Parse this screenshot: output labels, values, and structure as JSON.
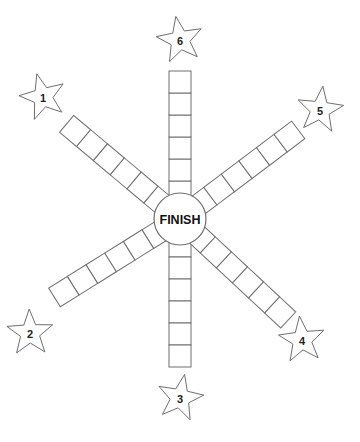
{
  "board": {
    "center_label": "FINISH",
    "arms": [
      {
        "id": "arm-1",
        "start_label": "1",
        "squares": 6
      },
      {
        "id": "arm-2",
        "start_label": "2",
        "squares": 6
      },
      {
        "id": "arm-3",
        "start_label": "3",
        "squares": 6
      },
      {
        "id": "arm-4",
        "start_label": "4",
        "squares": 6
      },
      {
        "id": "arm-5",
        "start_label": "5",
        "squares": 6
      },
      {
        "id": "arm-6",
        "start_label": "6",
        "squares": 6
      }
    ],
    "colors": {
      "line": "#6e6e6e",
      "text": "#111111",
      "background": "#ffffff"
    }
  }
}
